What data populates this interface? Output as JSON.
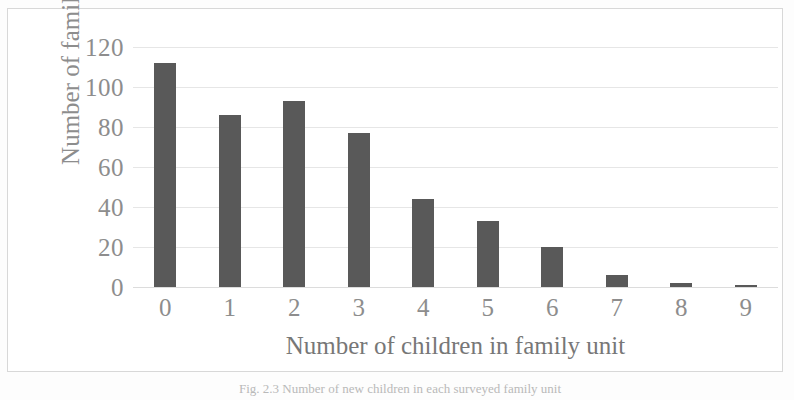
{
  "figure": {
    "caption": "Fig. 2.3  Number of new children in each surveyed family unit",
    "bar_color": "#595959",
    "grid_color": "#e6e6e6",
    "text_color": "#8d8d8d",
    "frame_color": "#d8d8d8",
    "background": "#ffffff"
  },
  "chart_data": {
    "type": "bar",
    "title": "",
    "xlabel": "Number of children in family unit",
    "ylabel": "Number of families",
    "categories": [
      "0",
      "1",
      "2",
      "3",
      "4",
      "5",
      "6",
      "7",
      "8",
      "9"
    ],
    "values": [
      112,
      86,
      93,
      77,
      44,
      33,
      20,
      6,
      2,
      1
    ],
    "ylim": [
      0,
      120
    ],
    "yticks": [
      0,
      20,
      40,
      60,
      80,
      100,
      120
    ],
    "ytick_labels": [
      "0",
      "20",
      "40",
      "60",
      "80",
      "100",
      "120"
    ],
    "grid": "horizontal",
    "legend": "none",
    "series": [
      {
        "name": "Number of families",
        "values": [
          112,
          86,
          93,
          77,
          44,
          33,
          20,
          6,
          2,
          1
        ]
      }
    ]
  }
}
